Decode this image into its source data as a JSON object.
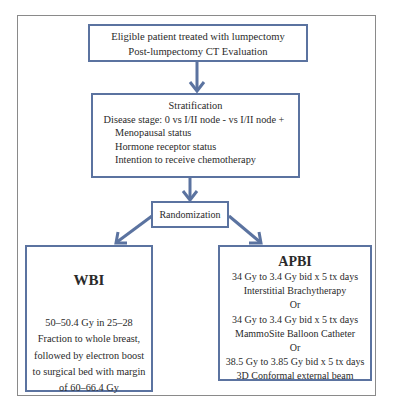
{
  "diagram": {
    "type": "flowchart",
    "colors": {
      "box_border": "#5b73a0",
      "arrow": "#5b73a0",
      "frame": "#8a8a8a",
      "text": "#2a2a2a"
    },
    "nodes": {
      "eligible": {
        "lines": [
          "Eligible patient treated with lumpectomy",
          "Post-lumpectomy CT Evaluation"
        ]
      },
      "stratification": {
        "title": "Stratification",
        "stage": "Disease stage: 0 vs I/II node - vs I/II node +",
        "items": [
          "Menopausal status",
          "Hormone receptor status",
          "Intention to receive chemotherapy"
        ]
      },
      "randomization": {
        "label": "Randomization"
      },
      "wbi": {
        "title": "WBI",
        "lines": [
          "50–50.4 Gy in 25–28",
          "Fraction to whole breast,",
          "followed by electron boost",
          "to surgical bed with margin",
          "of 60–66.4 Gy"
        ]
      },
      "apbi": {
        "title": "APBI",
        "lines": [
          "34 Gy to 3.4 Gy bid x 5 tx days",
          "Interstitial Brachytherapy",
          "Or",
          "34 Gy to 3.4 Gy bid x 5 tx days",
          "MammoSite Balloon Catheter",
          "Or",
          "38.5 Gy to 3.85 Gy bid x 5 tx days",
          "3D Conformal external beam"
        ]
      }
    },
    "edges": [
      {
        "from": "eligible",
        "to": "stratification"
      },
      {
        "from": "stratification",
        "to": "randomization"
      },
      {
        "from": "randomization",
        "to": "wbi"
      },
      {
        "from": "randomization",
        "to": "apbi"
      }
    ]
  }
}
